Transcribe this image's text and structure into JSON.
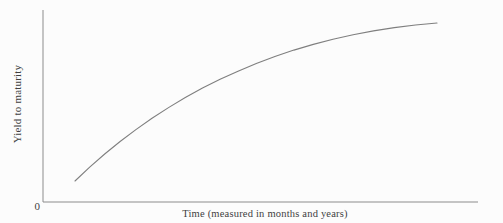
{
  "chart_data": {
    "type": "line",
    "title": "",
    "xlabel": "Time (measured in months and years)",
    "ylabel": "Yield to maturity",
    "origin_tick_label": "0",
    "x_range_norm": [
      0,
      1
    ],
    "y_range_norm": [
      0,
      1
    ],
    "grid": false,
    "legend": "none",
    "series": [
      {
        "name": "yield-curve",
        "points_norm": [
          [
            0.0736,
            0.1094
          ],
          [
            0.1073,
            0.1812
          ],
          [
            0.1419,
            0.2498
          ],
          [
            0.1773,
            0.3152
          ],
          [
            0.2135,
            0.3773
          ],
          [
            0.2506,
            0.4362
          ],
          [
            0.2885,
            0.4919
          ],
          [
            0.3272,
            0.5443
          ],
          [
            0.3667,
            0.5936
          ],
          [
            0.4071,
            0.6395
          ],
          [
            0.4483,
            0.681
          ],
          [
            0.4903,
            0.7218
          ],
          [
            0.5331,
            0.7581
          ],
          [
            0.5768,
            0.7912
          ],
          [
            0.6213,
            0.821
          ],
          [
            0.6667,
            0.8477
          ],
          [
            0.7128,
            0.871
          ],
          [
            0.7598,
            0.8912
          ],
          [
            0.8075,
            0.9082
          ],
          [
            0.8563,
            0.9218
          ],
          [
            0.9057,
            0.9323
          ]
        ]
      }
    ],
    "colors": {
      "background": "#fcfcfc",
      "axis": "#8c8c8c",
      "curve": "#7f7f7f",
      "text": "#3f3f3f"
    }
  }
}
